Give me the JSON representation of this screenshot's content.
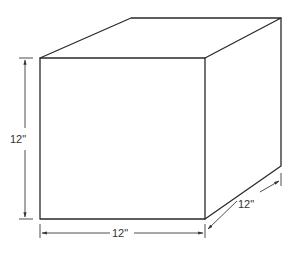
{
  "diagram": {
    "type": "cube-with-dimensions",
    "dimensions": {
      "height": "12\"",
      "width": "12\"",
      "depth": "12\""
    },
    "colors": {
      "line": "#2a2a2a",
      "background": "#ffffff"
    }
  }
}
